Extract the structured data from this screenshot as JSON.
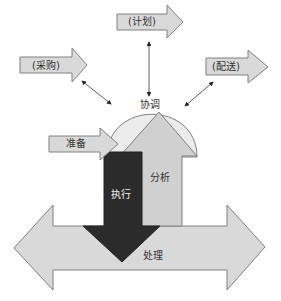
{
  "diagram": {
    "type": "process-arrow-diagram",
    "colors": {
      "light_fill": "#d9d9d9",
      "dome_fill": "#ececec",
      "dark_fill": "#2b2b2b",
      "stroke": "#808080",
      "connector": "#333333"
    },
    "nodes": {
      "plan": {
        "label": "(计划)"
      },
      "purchase": {
        "label": "(采购)"
      },
      "delivery": {
        "label": "(配送)"
      },
      "coordinate": {
        "label": "协调"
      },
      "prepare": {
        "label": "准备"
      },
      "analyze": {
        "label": "分析"
      },
      "execute": {
        "label": "执行"
      },
      "process": {
        "label": "处理"
      }
    },
    "connections": [
      {
        "from": "plan",
        "to": "coordinate",
        "style": "double-headed"
      },
      {
        "from": "purchase",
        "to": "coordinate",
        "style": "double-headed"
      },
      {
        "from": "delivery",
        "to": "coordinate",
        "style": "double-headed"
      }
    ]
  }
}
